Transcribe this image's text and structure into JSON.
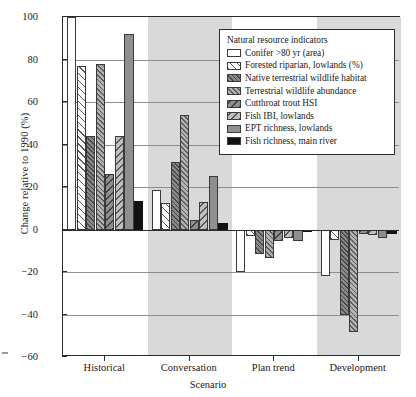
{
  "chart_data": {
    "type": "bar",
    "title": "",
    "xlabel": "Scenario",
    "ylabel": "Change relative to 1990 (%)",
    "categories": [
      "Historical",
      "Conversation",
      "Plan trend",
      "Development"
    ],
    "ylim": [
      -60,
      100
    ],
    "yticks": [
      100,
      80,
      60,
      40,
      20,
      0,
      -20,
      -40,
      -60
    ],
    "ytick_labels": [
      "100",
      "80",
      "60",
      "40",
      "20",
      "0",
      "−20",
      "−40",
      "−60"
    ],
    "grid": true,
    "legend_position": "top-right-inside",
    "legend_title": "Natural resource indicators",
    "series": [
      {
        "name": "Conifer >80 yr (area)",
        "pattern": "pat-open",
        "values": [
          100,
          18.5,
          -20,
          -22
        ]
      },
      {
        "name": "Forested riparian, lowlands (%)",
        "pattern": "pat-diag-light",
        "values": [
          77,
          12.5,
          -3,
          -5
        ]
      },
      {
        "name": "Native terrestrial wildlife habitat",
        "pattern": "pat-dark-dense",
        "values": [
          44,
          32,
          -11.5,
          -40
        ]
      },
      {
        "name": "Terrestrial wildlife abundance",
        "pattern": "pat-mid-dense",
        "values": [
          78,
          54,
          -13.5,
          -48
        ]
      },
      {
        "name": "Cutthroat trout HSI",
        "pattern": "pat-dark-diag",
        "values": [
          26,
          4.5,
          -5.5,
          -2
        ]
      },
      {
        "name": "Fish IBI, lowlands",
        "pattern": "pat-mid-diag",
        "values": [
          44,
          13,
          -4,
          -2.5
        ]
      },
      {
        "name": "EPT richness, lowlands",
        "pattern": "pat-solid-gray",
        "values": [
          92,
          25,
          -5.5,
          -4
        ]
      },
      {
        "name": "Fish richness, main river",
        "pattern": "pat-solid-black",
        "values": [
          13.5,
          3,
          -1,
          -2
        ]
      }
    ]
  },
  "axes": {
    "ylabel": "Change relative to 1990 (%)",
    "xlabel": "Scenario"
  },
  "legend": {
    "title": "Natural resource indicators"
  }
}
